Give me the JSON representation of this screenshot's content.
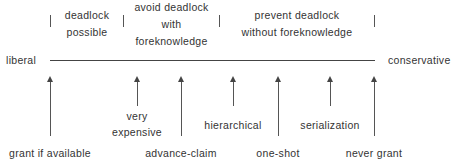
{
  "diagram": {
    "axis": {
      "left_label": "liberal",
      "right_label": "conservative"
    },
    "regions": [
      {
        "line1": "deadlock",
        "line2": "possible",
        "line3": ""
      },
      {
        "line1": "avoid deadlock",
        "line2": "with",
        "line3": "foreknowledge"
      },
      {
        "line1": "prevent deadlock",
        "line2": "without foreknowledge",
        "line3": ""
      }
    ],
    "strategies": [
      {
        "label": "grant if available",
        "level": "long"
      },
      {
        "label": "very expensive",
        "level": "short",
        "line1": "very",
        "line2": "expensive"
      },
      {
        "label": "advance-claim",
        "level": "long"
      },
      {
        "label": "hierarchical",
        "level": "short"
      },
      {
        "label": "one-shot",
        "level": "long"
      },
      {
        "label": "serialization",
        "level": "short"
      },
      {
        "label": "never grant",
        "level": "long"
      }
    ]
  }
}
